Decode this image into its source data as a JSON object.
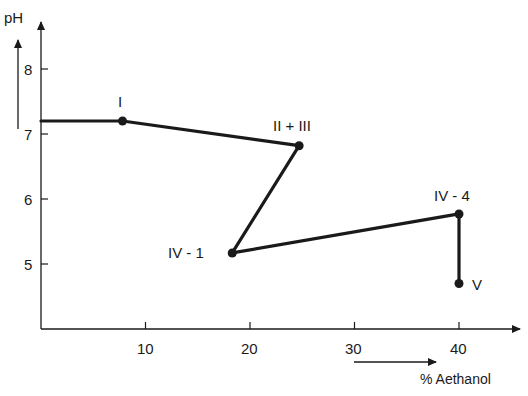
{
  "chart_data": {
    "type": "line",
    "title": "",
    "xlabel": "% Aethanol",
    "ylabel": "pH",
    "xlim": [
      0,
      45
    ],
    "ylim": [
      4,
      8.6
    ],
    "x_ticks": [
      10,
      20,
      30,
      40
    ],
    "y_ticks": [
      5,
      6,
      7,
      8
    ],
    "grid": false,
    "legend": null,
    "series": [
      {
        "name": "pH vs % Aethanol",
        "points": [
          {
            "x": 0,
            "y": 7.2,
            "label": ""
          },
          {
            "x": 7.8,
            "y": 7.2,
            "label": "I"
          },
          {
            "x": 24.7,
            "y": 6.82,
            "label": "II + III"
          },
          {
            "x": 18.3,
            "y": 5.17,
            "label": "IV - 1"
          },
          {
            "x": 40,
            "y": 5.77,
            "label": "IV - 4"
          },
          {
            "x": 40,
            "y": 4.7,
            "label": "V"
          }
        ]
      }
    ]
  },
  "axes": {
    "y_title": "pH",
    "x_title": "% Aethanol",
    "y_tick_labels": [
      "8",
      "7",
      "6",
      "5"
    ],
    "x_tick_labels": [
      "10",
      "20",
      "30",
      "40"
    ]
  },
  "point_labels": [
    "I",
    "II + III",
    "IV - 1",
    "IV - 4",
    "V"
  ],
  "colors": {
    "ink": "#1a1a1a",
    "background": "#ffffff"
  }
}
